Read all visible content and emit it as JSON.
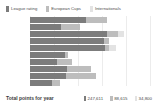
{
  "chart_data": {
    "type": "bar",
    "orientation": "horizontal",
    "stacked": true,
    "title": "",
    "xlabel": "",
    "ylabel": "",
    "grid": true,
    "legend_position": "top-left",
    "xlim": [
      0,
      130000
    ],
    "categories": [
      "",
      "",
      "",
      "",
      "",
      "",
      "",
      "",
      "",
      ""
    ],
    "series": [
      {
        "name": "League rating",
        "color": "#7c7c7c",
        "values": [
          56000,
          31000,
          77000,
          74000,
          75000,
          35000,
          27000,
          37000,
          36000,
          22000
        ]
      },
      {
        "name": "European Cups",
        "color": "#bdbdbd",
        "values": [
          21000,
          19000,
          11000,
          5000,
          4000,
          3000,
          15000,
          24000,
          30000,
          8000
        ]
      },
      {
        "name": "Internationals",
        "color": "#e3e3e3",
        "values": [
          0,
          0,
          6000,
          0,
          7000,
          0,
          0,
          0,
          0,
          0
        ]
      }
    ]
  },
  "legend": {
    "items": [
      {
        "label": "League rating",
        "color": "#7c7c7c"
      },
      {
        "label": "European Cups",
        "color": "#bdbdbd"
      },
      {
        "label": "Internationals",
        "color": "#e3e3e3"
      }
    ]
  },
  "rows": [
    {
      "label": "",
      "segments": [
        {
          "w": 56,
          "color": "#7c7c7c"
        },
        {
          "w": 21,
          "color": "#bdbdbd"
        },
        {
          "w": 0,
          "color": "#e3e3e3"
        }
      ]
    },
    {
      "label": "",
      "segments": [
        {
          "w": 31,
          "color": "#7c7c7c"
        },
        {
          "w": 19,
          "color": "#bdbdbd"
        },
        {
          "w": 0,
          "color": "#e3e3e3"
        }
      ]
    },
    {
      "label": "",
      "segments": [
        {
          "w": 77,
          "color": "#7c7c7c"
        },
        {
          "w": 11,
          "color": "#bdbdbd"
        },
        {
          "w": 6,
          "color": "#e3e3e3"
        }
      ]
    },
    {
      "label": "",
      "segments": [
        {
          "w": 74,
          "color": "#7c7c7c"
        },
        {
          "w": 5,
          "color": "#bdbdbd"
        },
        {
          "w": 0,
          "color": "#e3e3e3"
        }
      ]
    },
    {
      "label": "",
      "segments": [
        {
          "w": 75,
          "color": "#7c7c7c"
        },
        {
          "w": 4,
          "color": "#bdbdbd"
        },
        {
          "w": 7,
          "color": "#e3e3e3"
        }
      ]
    },
    {
      "label": "",
      "segments": [
        {
          "w": 35,
          "color": "#7c7c7c"
        },
        {
          "w": 3,
          "color": "#bdbdbd"
        },
        {
          "w": 0,
          "color": "#e3e3e3"
        }
      ]
    },
    {
      "label": "",
      "segments": [
        {
          "w": 27,
          "color": "#7c7c7c"
        },
        {
          "w": 15,
          "color": "#bdbdbd"
        },
        {
          "w": 0,
          "color": "#e3e3e3"
        }
      ]
    },
    {
      "label": "",
      "segments": [
        {
          "w": 37,
          "color": "#7c7c7c"
        },
        {
          "w": 24,
          "color": "#bdbdbd"
        },
        {
          "w": 0,
          "color": "#e3e3e3"
        }
      ]
    },
    {
      "label": "",
      "segments": [
        {
          "w": 36,
          "color": "#7c7c7c"
        },
        {
          "w": 30,
          "color": "#bdbdbd"
        },
        {
          "w": 0,
          "color": "#e3e3e3"
        }
      ]
    },
    {
      "label": "",
      "segments": [
        {
          "w": 22,
          "color": "#7c7c7c"
        },
        {
          "w": 8,
          "color": "#bdbdbd"
        },
        {
          "w": 0,
          "color": "#e3e3e3"
        }
      ]
    }
  ],
  "gridlines": [
    0,
    20,
    40,
    60,
    80,
    100
  ],
  "footer": {
    "title": "Total points for year",
    "totals": [
      {
        "value": "247,611",
        "color": "#7c7c7c"
      },
      {
        "value": "88,615",
        "color": "#bdbdbd"
      },
      {
        "value": "34,800",
        "color": "#e3e3e3"
      }
    ]
  },
  "colors": {
    "series_1": "#7c7c7c",
    "series_2": "#bdbdbd",
    "series_3": "#e3e3e3",
    "grid": "#ececec",
    "background": "#ffffff",
    "text": "#4a4a4a"
  }
}
